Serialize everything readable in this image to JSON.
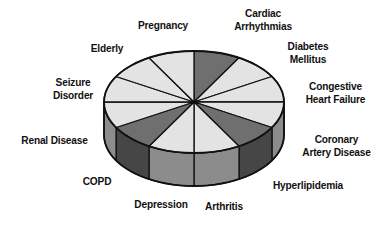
{
  "chart_data": {
    "type": "pie",
    "style": "3d",
    "title": "",
    "categories": [
      "Cardiac Arrhythmias",
      "Diabetes Mellitus",
      "Congestive Heart Failure",
      "Coronary Artery Disease",
      "Hyperlipidemia",
      "Arthritis",
      "Depression",
      "COPD",
      "Renal Disease",
      "Seizure Disorder",
      "Elderly",
      "Pregnancy"
    ],
    "values": [
      1,
      1,
      1,
      1,
      1,
      1,
      1,
      1,
      1,
      1,
      1,
      1
    ],
    "highlighted": [
      "Cardiac Arrhythmias",
      "Hyperlipidemia",
      "COPD"
    ],
    "legend": "none (slices labeled directly)",
    "grid": false
  },
  "colors": {
    "light_top": "#e3e3e3",
    "dark_top": "#6f6f6f",
    "dark_side": "#464646",
    "mid_side": "#8c8c8c",
    "edge": "#111111"
  },
  "labels": {
    "cardiac": "Cardiac\nArrhythmias",
    "diabetes": "Diabetes\nMellitus",
    "chf": "Congestive\nHeart Failure",
    "cad": "Coronary\nArtery Disease",
    "hyperlipidemia": "Hyperlipidemia",
    "arthritis": "Arthritis",
    "depression": "Depression",
    "copd": "COPD",
    "renal": "Renal Disease",
    "seizure": "Seizure\nDisorder",
    "elderly": "Elderly",
    "pregnancy": "Pregnancy"
  }
}
